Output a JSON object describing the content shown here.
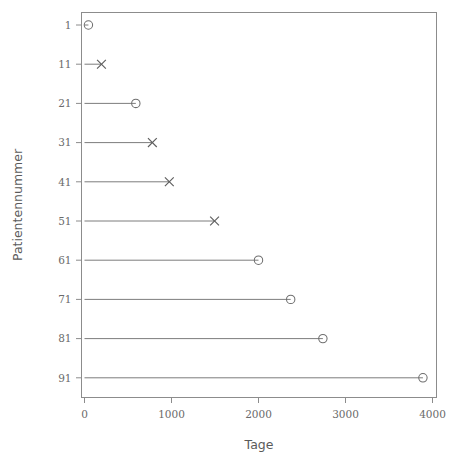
{
  "chart_data": {
    "type": "scatter",
    "title": "",
    "xlabel": "Tage",
    "ylabel": "Patientennummer",
    "xlim": [
      0,
      4100
    ],
    "ylim": [
      0,
      96
    ],
    "grid": false,
    "legend": "none",
    "x_ticks": [
      0,
      1000,
      2000,
      3000,
      4000
    ],
    "x_tick_labels": [
      "0",
      "1000",
      "2000",
      "3000",
      "4000"
    ],
    "y_ticks": [
      1,
      11,
      21,
      31,
      41,
      51,
      61,
      71,
      81,
      91
    ],
    "y_tick_labels": [
      "1",
      "11",
      "21",
      "31",
      "41",
      "51",
      "61",
      "71",
      "81",
      "91"
    ],
    "marker_legend": {
      "circle": "censored",
      "cross": "event"
    },
    "points": [
      {
        "patient": 1,
        "days": 45,
        "marker": "circle"
      },
      {
        "patient": 11,
        "days": 195,
        "marker": "cross"
      },
      {
        "patient": 21,
        "days": 590,
        "marker": "circle"
      },
      {
        "patient": 31,
        "days": 780,
        "marker": "cross"
      },
      {
        "patient": 41,
        "days": 975,
        "marker": "cross"
      },
      {
        "patient": 51,
        "days": 1495,
        "marker": "cross"
      },
      {
        "patient": 61,
        "days": 2000,
        "marker": "circle"
      },
      {
        "patient": 71,
        "days": 2370,
        "marker": "circle"
      },
      {
        "patient": 81,
        "days": 2740,
        "marker": "circle"
      },
      {
        "patient": 91,
        "days": 3890,
        "marker": "circle"
      }
    ]
  }
}
